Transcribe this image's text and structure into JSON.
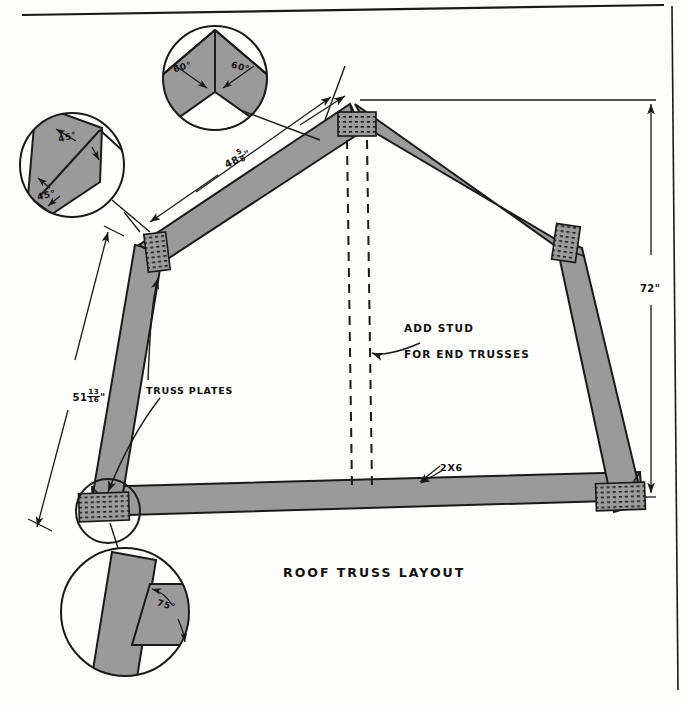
{
  "drawing": {
    "title": "ROOF TRUSS LAYOUT",
    "type": "architectural-detail",
    "sheet_size": "683x706"
  },
  "dimensions": {
    "rafter_top": {
      "whole": "48",
      "numerator": "5",
      "denominator": "8",
      "unit": "\""
    },
    "rafter_lower": {
      "whole": "51",
      "numerator": "13",
      "denominator": "16",
      "unit": "\""
    },
    "height_right": "72\""
  },
  "angles": {
    "peak_left": "60°",
    "peak_right": "60°",
    "knee_upper": "45°",
    "knee_lower": "45°",
    "heel": "75°"
  },
  "labels": {
    "truss_plates": "TRUSS PLATES",
    "add_stud_line1": "ADD STUD",
    "add_stud_line2": "FOR END TRUSSES",
    "lumber": "2X6"
  },
  "colors": {
    "member_fill": "#9a9a9a",
    "line": "#1a1a1a",
    "plate_fill": "#8f8f8f",
    "paper": "#fdfdfb"
  },
  "detail_circles": [
    {
      "name": "peak-detail",
      "cx": 215,
      "cy": 78,
      "r": 52,
      "angles": [
        "60°",
        "60°"
      ]
    },
    {
      "name": "knee-detail",
      "cx": 72,
      "cy": 165,
      "r": 52,
      "angles": [
        "45°",
        "45°"
      ]
    },
    {
      "name": "heel-detail",
      "cx": 125,
      "cy": 612,
      "r": 64,
      "angles": [
        "75°"
      ]
    }
  ],
  "truss_plates_positions": [
    {
      "name": "plate-peak",
      "x": 355,
      "y": 123
    },
    {
      "name": "plate-left-knee",
      "x": 157,
      "y": 252
    },
    {
      "name": "plate-right-knee",
      "x": 566,
      "y": 243
    },
    {
      "name": "plate-left-heel",
      "x": 103,
      "y": 508
    },
    {
      "name": "plate-right-heel",
      "x": 620,
      "y": 497
    }
  ]
}
